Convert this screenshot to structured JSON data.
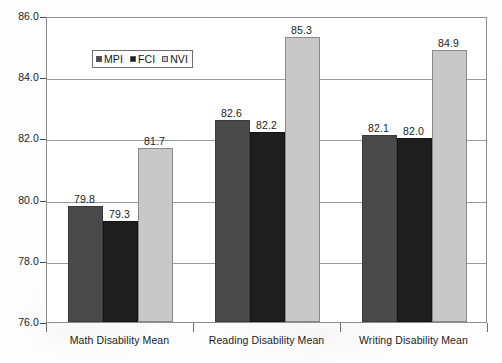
{
  "chart_data": {
    "type": "bar",
    "title": "",
    "xlabel": "",
    "ylabel": "Standard Score",
    "ylim": [
      76.0,
      86.0
    ],
    "ytick_step": 2.0,
    "ytick_labels": [
      "86.0",
      "84.0",
      "82.0",
      "80.0",
      "78.0",
      "76.0"
    ],
    "ytick_values": [
      86.0,
      84.0,
      82.0,
      80.0,
      78.0,
      76.0
    ],
    "grid": true,
    "legend_position": "inside-upper-left",
    "categories": [
      "Math Disability Mean",
      "Reading Disability Mean",
      "Writing Disability Mean"
    ],
    "series": [
      {
        "name": "MPI",
        "color": "#4a4a4a",
        "values": [
          79.8,
          79.3,
          82.1
        ],
        "labels": [
          "79.8",
          "79.3",
          "82.1"
        ]
      },
      {
        "name": "FCI",
        "color": "#1e1e1e",
        "values": [
          79.3,
          82.2,
          82.0
        ],
        "labels": [
          "79.3",
          "82.2",
          "82.0"
        ]
      },
      {
        "name": "NVI",
        "color": "#c8c8c8",
        "values": [
          81.7,
          85.3,
          84.9
        ],
        "labels": [
          "81.7",
          "85.3",
          "84.9"
        ]
      }
    ],
    "groups": [
      {
        "category": "Math Disability Mean",
        "bars": [
          {
            "series": "MPI",
            "value": 79.8,
            "label": "79.8"
          },
          {
            "series": "FCI",
            "value": 79.3,
            "label": "79.3"
          },
          {
            "series": "NVI",
            "value": 81.7,
            "label": "81.7"
          }
        ]
      },
      {
        "category": "Reading Disability Mean",
        "bars": [
          {
            "series": "MPI",
            "value": 82.6,
            "label": "82.6"
          },
          {
            "series": "FCI",
            "value": 82.2,
            "label": "82.2"
          },
          {
            "series": "NVI",
            "value": 85.3,
            "label": "85.3"
          }
        ]
      },
      {
        "category": "Writing Disability Mean",
        "bars": [
          {
            "series": "MPI",
            "value": 82.1,
            "label": "82.1"
          },
          {
            "series": "FCI",
            "value": 82.0,
            "label": "82.0"
          },
          {
            "series": "NVI",
            "value": 84.9,
            "label": "84.9"
          }
        ]
      }
    ]
  },
  "legend": {
    "items": [
      {
        "label": "MPI",
        "color": "#4a4a4a"
      },
      {
        "label": "FCI",
        "color": "#1e1e1e"
      },
      {
        "label": "NVI",
        "color": "#c8c8c8"
      }
    ]
  },
  "axes": {
    "y_title": "Standard Score"
  },
  "colors": {
    "mpi": "#4a4a4a",
    "fci": "#1e1e1e",
    "nvi": "#c8c8c8",
    "frame": "#8e8e8e",
    "gridline": "#9a9a9a",
    "text": "#1b1b1b"
  }
}
